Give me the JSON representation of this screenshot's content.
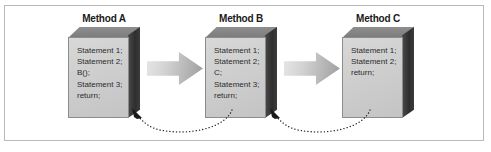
{
  "figure": {
    "caption": "",
    "frame_color": "#b9b9b9",
    "background_color": "#ffffff"
  },
  "methods": [
    {
      "heading": "Method A",
      "statements": [
        "Statement 1;",
        "Statement 2;",
        "B();",
        "Statement 3;",
        "return;"
      ]
    },
    {
      "heading": "Method B",
      "statements": [
        "Statement 1;",
        "Statement 2;",
        "C;",
        "Statement 3;",
        "return;"
      ]
    },
    {
      "heading": "Method C",
      "statements": [
        "Statement 1;",
        "Statement 2;",
        "return;"
      ]
    }
  ],
  "call_arrows": [
    {
      "from": "Method A",
      "to": "Method B",
      "style": "solid-block-arrow"
    },
    {
      "from": "Method B",
      "to": "Method C",
      "style": "solid-block-arrow"
    }
  ],
  "return_arrows": [
    {
      "from": "Method B",
      "to": "Method A",
      "style": "dotted-curved-arrow"
    },
    {
      "from": "Method C",
      "to": "Method B",
      "style": "dotted-curved-arrow"
    }
  ],
  "colors": {
    "box_front": "#d2d2d2",
    "box_top": "#848484",
    "box_side": "#333333",
    "arrow_fill": "#c4c4c4",
    "text": "#2b2b2b",
    "heading_text": "#1a1a1a"
  }
}
